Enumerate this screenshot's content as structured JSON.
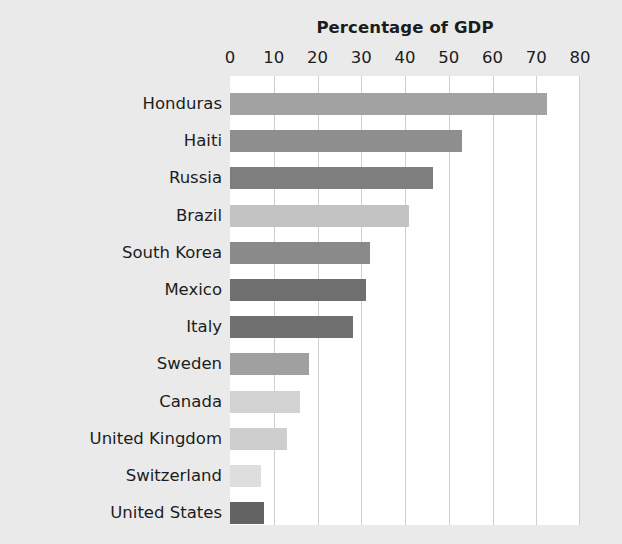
{
  "chart_data": {
    "type": "bar",
    "orientation": "horizontal",
    "title": "Percentage of GDP",
    "xlabel": "",
    "ylabel": "",
    "xlim": [
      0,
      80
    ],
    "ylim": null,
    "grid": true,
    "legend": null,
    "xticks": [
      0,
      10,
      20,
      30,
      40,
      50,
      60,
      70,
      80
    ],
    "xtick_labels": [
      "0",
      "10",
      "20",
      "30",
      "40",
      "50",
      "60",
      "70",
      "80"
    ],
    "categories": [
      "Honduras",
      "Haiti",
      "Russia",
      "Brazil",
      "South Korea",
      "Mexico",
      "Italy",
      "Sweden",
      "Canada",
      "United Kingdom",
      "Switzerland",
      "United States"
    ],
    "values": [
      72.5,
      53,
      46.5,
      41,
      32,
      31,
      28,
      18,
      16,
      13,
      7,
      7.8
    ],
    "bar_colors": [
      "#a3a3a3",
      "#8e8e8e",
      "#7e7e7e",
      "#c3c3c3",
      "#8a8a8a",
      "#6f6f6f",
      "#707070",
      "#a0a0a0",
      "#d2d2d2",
      "#cecece",
      "#dedede",
      "#636363"
    ]
  },
  "style": {
    "background_color": "#eaeaea",
    "plot_background_color": "#ffffff",
    "gridline_color": "#cfcfcf",
    "text_color": "#1c1c1c"
  }
}
